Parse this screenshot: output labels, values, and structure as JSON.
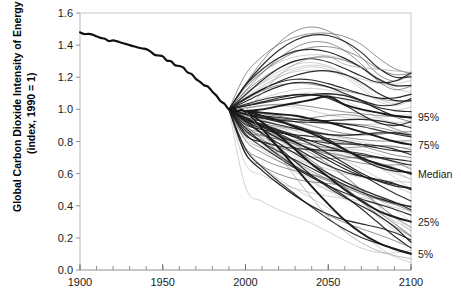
{
  "chart_data": {
    "type": "line",
    "title": "",
    "subtitle": "",
    "xlabel": "",
    "ylabel": "Global Carbon Dioxide Intensity of Energy",
    "ylabel_line2": "(index, 1990 = 1)",
    "xlim": [
      1900,
      2100
    ],
    "ylim": [
      0.0,
      1.6
    ],
    "grid": false,
    "legend_position": "right-outside",
    "xticks": [
      1900,
      1950,
      2000,
      2050,
      2100
    ],
    "xtick_labels": [
      "1900",
      "1950",
      "2000",
      "2050",
      "2100"
    ],
    "xtick_minor_step": 10,
    "yticks": [
      0.0,
      0.2,
      0.4,
      0.6,
      0.8,
      1.0,
      1.2,
      1.4,
      1.6
    ],
    "ytick_labels": [
      "0.0",
      "0.2",
      "0.4",
      "0.6",
      "0.8",
      "1.0",
      "1.2",
      "1.4",
      "1.6"
    ],
    "annotations": [
      {
        "text": "95%",
        "year": 2100,
        "value": 0.95
      },
      {
        "text": "75%",
        "year": 2100,
        "value": 0.78
      },
      {
        "text": "Median",
        "year": 2100,
        "value": 0.6
      },
      {
        "text": "25%",
        "year": 2100,
        "value": 0.3
      },
      {
        "text": "5%",
        "year": 2100,
        "value": 0.1
      }
    ],
    "series": [
      {
        "name": "Historical",
        "style": "thick-black",
        "x": [
          1900,
          1905,
          1910,
          1915,
          1920,
          1925,
          1930,
          1935,
          1940,
          1945,
          1950,
          1955,
          1960,
          1965,
          1970,
          1975,
          1980,
          1985,
          1990,
          1995,
          2000
        ],
        "values": [
          1.48,
          1.47,
          1.455,
          1.44,
          1.43,
          1.415,
          1.4,
          1.385,
          1.375,
          1.34,
          1.33,
          1.3,
          1.27,
          1.23,
          1.19,
          1.15,
          1.11,
          1.05,
          1.0,
          0.99,
          0.985
        ]
      },
      {
        "name": "Upper envelope",
        "style": "thin-gray",
        "x": [
          2000,
          2010,
          2020,
          2030,
          2040,
          2050,
          2060,
          2070,
          2080,
          2090,
          2100
        ],
        "values": [
          0.99,
          1.1,
          1.21,
          1.28,
          1.32,
          1.33,
          1.28,
          1.26,
          1.25,
          1.24,
          1.23
        ]
      },
      {
        "name": "95th percentile",
        "style": "thick-black",
        "x": [
          2000,
          2010,
          2020,
          2030,
          2040,
          2050,
          2060,
          2070,
          2080,
          2090,
          2100
        ],
        "values": [
          0.99,
          1.0,
          1.02,
          1.04,
          1.06,
          1.08,
          1.03,
          1.0,
          0.98,
          0.96,
          0.95
        ]
      },
      {
        "name": "75th percentile",
        "style": "thick-black",
        "x": [
          2000,
          2010,
          2020,
          2030,
          2040,
          2050,
          2060,
          2070,
          2080,
          2090,
          2100
        ],
        "values": [
          0.99,
          0.98,
          0.97,
          0.96,
          0.94,
          0.92,
          0.89,
          0.86,
          0.83,
          0.8,
          0.78
        ]
      },
      {
        "name": "Median",
        "style": "thick-black",
        "x": [
          2000,
          2010,
          2020,
          2030,
          2040,
          2050,
          2060,
          2070,
          2080,
          2090,
          2100
        ],
        "values": [
          0.99,
          0.96,
          0.93,
          0.89,
          0.85,
          0.8,
          0.75,
          0.7,
          0.66,
          0.63,
          0.6
        ]
      },
      {
        "name": "25th percentile",
        "style": "thick-black",
        "x": [
          2000,
          2010,
          2020,
          2030,
          2040,
          2050,
          2060,
          2070,
          2080,
          2090,
          2100
        ],
        "values": [
          0.99,
          0.92,
          0.84,
          0.75,
          0.66,
          0.58,
          0.5,
          0.43,
          0.37,
          0.33,
          0.3
        ]
      },
      {
        "name": "5th percentile",
        "style": "thick-black",
        "x": [
          2000,
          2010,
          2020,
          2030,
          2040,
          2050,
          2060,
          2070,
          2080,
          2090,
          2100
        ],
        "values": [
          0.99,
          0.88,
          0.76,
          0.64,
          0.52,
          0.41,
          0.31,
          0.23,
          0.17,
          0.13,
          0.1
        ]
      },
      {
        "name": "Lower envelope",
        "style": "thin-gray",
        "x": [
          2000,
          2010,
          2020,
          2030,
          2040,
          2050,
          2060,
          2070,
          2080,
          2090,
          2100
        ],
        "values": [
          0.99,
          0.86,
          0.72,
          0.58,
          0.45,
          0.33,
          0.24,
          0.17,
          0.12,
          0.09,
          0.07
        ]
      }
    ],
    "scenario_count": 80,
    "scenario_branch_year": 1990,
    "colors": {
      "historical": "#111111",
      "scenario_thin": "#9a9a9a",
      "scenario_thick": "#1a1a1a",
      "axis": "#b9b9b9",
      "text": "#1a1a1a",
      "background": "#ffffff"
    }
  }
}
